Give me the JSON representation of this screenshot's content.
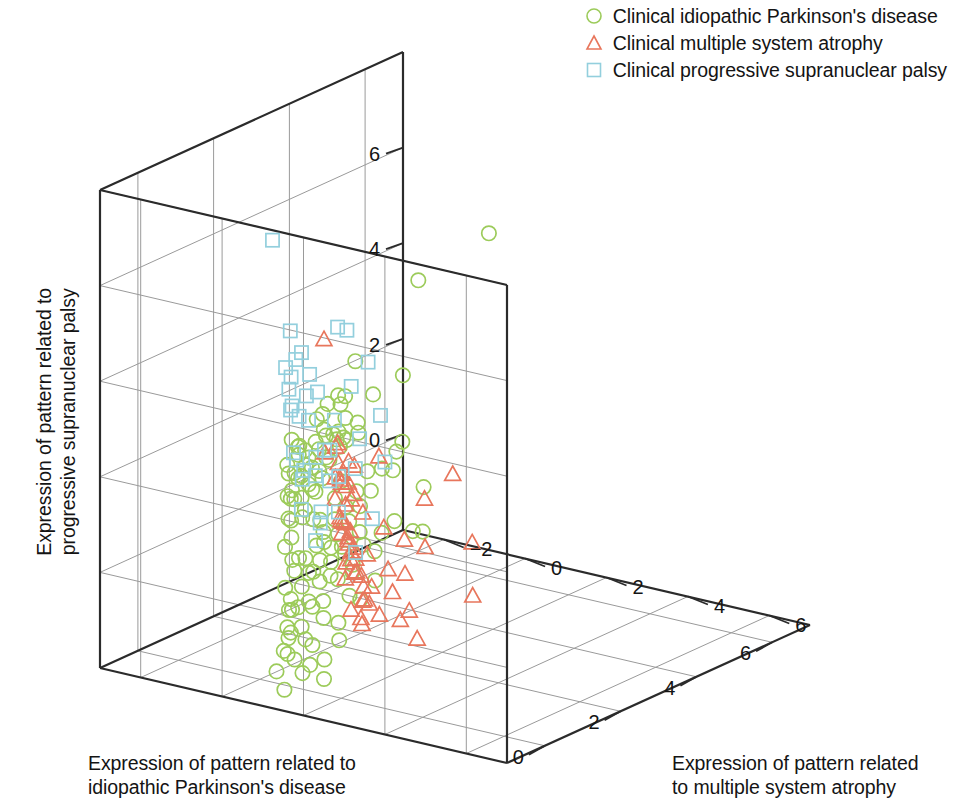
{
  "legend": {
    "position": "top-right",
    "items": [
      {
        "label": "Clinical idiopathic Parkinson's disease",
        "marker": "circle-marker",
        "color": "#9ccb5a"
      },
      {
        "label": "Clinical multiple system atrophy",
        "marker": "triangle-marker",
        "color": "#e8765c"
      },
      {
        "label": "Clinical progressive supranuclear palsy",
        "marker": "square-marker",
        "color": "#93cfdd"
      }
    ]
  },
  "axes": {
    "x": {
      "label_line1": "Expression of pattern related to",
      "label_line2": "idiopathic Parkinson's disease",
      "ticks": [
        "6",
        "4",
        "2",
        "0"
      ],
      "tick_values": [
        6,
        4,
        2,
        0
      ],
      "range": [
        -1,
        7
      ]
    },
    "y": {
      "label_line1": "Expression of pattern related to",
      "label_line2": "progressive supranuclear palsy",
      "ticks": [
        "0",
        "2",
        "4",
        "6"
      ],
      "tick_values": [
        0,
        2,
        4,
        6
      ],
      "range": [
        -2,
        8
      ]
    },
    "z": {
      "label_line1": "Expression of pattern related",
      "label_line2": "to multiple system atrophy",
      "ticks": [
        "−2",
        "0",
        "2",
        "4",
        "6"
      ],
      "tick_values": [
        -2,
        0,
        2,
        4,
        6
      ],
      "range": [
        -3,
        7
      ]
    }
  },
  "chart_data": {
    "type": "scatter",
    "projection": "3d",
    "title": "",
    "xlabel": "Expression of pattern related to idiopathic Parkinson's disease",
    "ylabel": "Expression of pattern related to progressive supranuclear palsy",
    "zlabel": "Expression of pattern related to multiple system atrophy",
    "xlim": [
      -1,
      7
    ],
    "ylim": [
      -2,
      8
    ],
    "zlim": [
      -3,
      7
    ],
    "grid": true,
    "legend_position": "top-right",
    "series": [
      {
        "name": "Clinical idiopathic Parkinson's disease",
        "marker": "circle",
        "color": "#9ccb5a",
        "points": [
          [
            5.9,
            3.9,
            -1.6
          ],
          [
            5.4,
            5.5,
            0.6
          ],
          [
            5.6,
            2.0,
            -1.7
          ],
          [
            4.6,
            2.0,
            -1.5
          ],
          [
            5.8,
            0.5,
            -1.9
          ],
          [
            4.3,
            1.5,
            -1.6
          ],
          [
            4.1,
            1.4,
            -1.4
          ],
          [
            3.9,
            1.3,
            -1.5
          ],
          [
            3.6,
            1.5,
            -1.3
          ],
          [
            3.4,
            1.4,
            -1.2
          ],
          [
            3.7,
            3.1,
            -1.1
          ],
          [
            3.2,
            2.4,
            -1.0
          ],
          [
            3.1,
            1.7,
            -1.0
          ],
          [
            2.9,
            1.9,
            -0.9
          ],
          [
            2.8,
            1.4,
            -0.9
          ],
          [
            3.0,
            0.9,
            -0.8
          ],
          [
            2.6,
            2.0,
            -0.8
          ],
          [
            2.5,
            1.6,
            -0.7
          ],
          [
            2.4,
            1.2,
            -0.7
          ],
          [
            2.3,
            2.6,
            -0.6
          ],
          [
            2.2,
            1.9,
            -0.6
          ],
          [
            2.1,
            1.5,
            -0.5
          ],
          [
            2.0,
            1.1,
            -0.5
          ],
          [
            1.9,
            2.2,
            -0.4
          ],
          [
            1.8,
            1.7,
            -0.4
          ],
          [
            1.7,
            1.3,
            -0.3
          ],
          [
            1.6,
            2.0,
            -0.3
          ],
          [
            1.5,
            1.5,
            -0.2
          ],
          [
            1.4,
            1.0,
            -0.2
          ],
          [
            1.3,
            2.3,
            -0.1
          ],
          [
            1.2,
            1.8,
            -0.1
          ],
          [
            1.1,
            1.4,
            0.0
          ],
          [
            1.0,
            2.5,
            0.0
          ],
          [
            0.9,
            1.9,
            0.1
          ],
          [
            0.8,
            1.5,
            0.1
          ],
          [
            0.7,
            2.1,
            0.2
          ],
          [
            0.6,
            1.6,
            0.2
          ],
          [
            0.5,
            1.2,
            0.3
          ],
          [
            0.4,
            2.4,
            0.3
          ],
          [
            0.3,
            1.8,
            0.4
          ],
          [
            5.0,
            0.7,
            -1.3
          ],
          [
            4.8,
            0.4,
            -1.2
          ],
          [
            4.4,
            0.6,
            -1.1
          ],
          [
            4.0,
            0.3,
            -1.0
          ],
          [
            3.8,
            0.8,
            -0.9
          ],
          [
            3.5,
            0.2,
            -0.8
          ],
          [
            3.3,
            0.6,
            -0.7
          ],
          [
            3.0,
            0.1,
            -0.6
          ],
          [
            2.8,
            0.5,
            -0.5
          ],
          [
            2.6,
            0.0,
            -0.5
          ],
          [
            2.4,
            0.4,
            -0.4
          ],
          [
            2.2,
            -0.1,
            -0.3
          ],
          [
            2.0,
            0.3,
            -0.3
          ],
          [
            1.8,
            -0.2,
            -0.2
          ],
          [
            1.6,
            0.2,
            -0.1
          ],
          [
            1.4,
            -0.3,
            -0.1
          ],
          [
            1.2,
            0.1,
            0.0
          ],
          [
            1.0,
            -0.4,
            0.1
          ],
          [
            0.8,
            0.0,
            0.1
          ],
          [
            0.6,
            -0.5,
            0.2
          ],
          [
            4.5,
            -0.8,
            -1.2
          ],
          [
            4.1,
            -1.0,
            -1.0
          ],
          [
            3.7,
            -0.7,
            -0.9
          ],
          [
            3.3,
            -1.1,
            -0.8
          ],
          [
            3.0,
            -0.6,
            -0.7
          ],
          [
            2.7,
            -1.0,
            -0.6
          ],
          [
            2.4,
            -0.8,
            -0.5
          ],
          [
            2.1,
            -1.2,
            -0.4
          ],
          [
            1.9,
            -0.7,
            -0.3
          ],
          [
            1.6,
            -1.1,
            -0.2
          ],
          [
            1.4,
            -0.9,
            -0.1
          ],
          [
            1.1,
            -1.3,
            0.0
          ],
          [
            0.9,
            -0.8,
            0.1
          ],
          [
            0.6,
            -1.2,
            0.2
          ],
          [
            0.4,
            -1.0,
            0.3
          ],
          [
            0.2,
            -1.4,
            0.4
          ],
          [
            3.9,
            -1.5,
            -0.8
          ],
          [
            3.4,
            -1.7,
            -0.7
          ],
          [
            2.9,
            -1.4,
            -0.5
          ],
          [
            2.5,
            -1.8,
            -0.4
          ],
          [
            2.0,
            -1.5,
            -0.3
          ],
          [
            1.6,
            -1.9,
            -0.2
          ],
          [
            1.2,
            -1.6,
            0.0
          ],
          [
            0.7,
            -1.8,
            0.2
          ],
          [
            0.3,
            -1.5,
            0.4
          ],
          [
            -0.1,
            -1.7,
            0.5
          ],
          [
            1.0,
            -2.0,
            0.3
          ],
          [
            2.2,
            -2.0,
            -0.1
          ],
          [
            0.5,
            2.8,
            0.5
          ],
          [
            0.2,
            2.0,
            0.6
          ],
          [
            0.0,
            1.5,
            0.7
          ],
          [
            -0.2,
            1.0,
            0.8
          ],
          [
            0.1,
            0.6,
            0.7
          ],
          [
            -0.3,
            0.2,
            0.9
          ],
          [
            0.3,
            3.0,
            0.5
          ],
          [
            -0.1,
            2.5,
            0.8
          ],
          [
            1.5,
            2.9,
            0.0
          ],
          [
            2.0,
            3.0,
            -0.2
          ],
          [
            2.6,
            2.9,
            -0.5
          ],
          [
            3.0,
            2.7,
            -0.7
          ],
          [
            1.3,
            0.9,
            0.1
          ],
          [
            1.7,
            0.7,
            -0.1
          ],
          [
            2.3,
            0.9,
            -0.3
          ],
          [
            0.9,
            1.1,
            0.2
          ],
          [
            0.4,
            0.9,
            0.4
          ],
          [
            1.1,
            2.1,
            0.1
          ],
          [
            0.7,
            2.5,
            0.3
          ],
          [
            1.9,
            2.5,
            -0.2
          ],
          [
            2.5,
            2.2,
            -0.4
          ],
          [
            2.9,
            2.3,
            -0.6
          ],
          [
            0.2,
            -0.5,
            0.6
          ],
          [
            0.0,
            -1.0,
            0.7
          ],
          [
            -0.2,
            -0.3,
            0.9
          ],
          [
            0.6,
            0.4,
            0.4
          ],
          [
            1.3,
            -0.2,
            0.1
          ],
          [
            1.8,
            0.2,
            -0.1
          ],
          [
            2.2,
            -0.4,
            -0.3
          ],
          [
            2.7,
            -0.3,
            -0.5
          ],
          [
            3.2,
            -0.9,
            -0.7
          ],
          [
            3.6,
            -0.4,
            -0.9
          ],
          [
            0.8,
            -2.1,
            0.3
          ],
          [
            1.7,
            -2.2,
            0.0
          ],
          [
            0.0,
            -2.1,
            0.6
          ],
          [
            2.6,
            1.4,
            1.6
          ],
          [
            2.1,
            0.7,
            1.8
          ],
          [
            1.4,
            1.2,
            2.0
          ],
          [
            2.9,
            0.3,
            1.3
          ],
          [
            0.4,
            -1.9,
            1.2
          ]
        ]
      },
      {
        "name": "Clinical multiple system atrophy",
        "marker": "triangle",
        "color": "#e8765c",
        "points": [
          [
            0.4,
            5.2,
            1.2
          ],
          [
            -0.3,
            3.4,
            3.2
          ],
          [
            -0.6,
            2.9,
            4.6
          ],
          [
            -0.5,
            3.5,
            5.2
          ],
          [
            -0.2,
            2.8,
            2.2
          ],
          [
            0.0,
            2.5,
            2.0
          ],
          [
            0.3,
            2.4,
            1.7
          ],
          [
            0.6,
            2.9,
            1.3
          ],
          [
            -0.4,
            2.2,
            2.9
          ],
          [
            -0.6,
            2.1,
            3.6
          ],
          [
            -0.7,
            2.0,
            4.2
          ],
          [
            -0.8,
            2.0,
            4.8
          ],
          [
            -0.3,
            1.7,
            2.5
          ],
          [
            -0.1,
            1.5,
            2.1
          ],
          [
            0.2,
            1.6,
            1.8
          ],
          [
            0.5,
            1.5,
            1.5
          ],
          [
            0.8,
            1.7,
            1.1
          ],
          [
            -0.5,
            1.4,
            3.1
          ],
          [
            -0.7,
            1.3,
            3.8
          ],
          [
            -0.9,
            1.4,
            4.4
          ],
          [
            0.0,
            1.2,
            2.3
          ],
          [
            0.3,
            1.1,
            1.9
          ],
          [
            0.6,
            1.0,
            1.6
          ],
          [
            0.9,
            1.2,
            1.2
          ],
          [
            -0.4,
            0.9,
            2.7
          ],
          [
            -0.6,
            0.8,
            3.3
          ],
          [
            -0.8,
            0.9,
            4.0
          ],
          [
            -1.0,
            0.7,
            4.6
          ],
          [
            0.1,
            0.6,
            2.4
          ],
          [
            0.4,
            0.5,
            2.0
          ],
          [
            0.7,
            0.6,
            1.7
          ],
          [
            1.0,
            0.4,
            1.3
          ],
          [
            -0.3,
            0.3,
            2.8
          ],
          [
            -0.5,
            0.2,
            3.4
          ],
          [
            -0.7,
            0.3,
            4.1
          ],
          [
            -0.9,
            0.1,
            4.7
          ],
          [
            0.2,
            0.0,
            2.5
          ],
          [
            0.5,
            -0.1,
            2.1
          ],
          [
            0.8,
            0.0,
            1.8
          ],
          [
            1.2,
            1.8,
            1.0
          ],
          [
            1.4,
            1.3,
            0.8
          ],
          [
            1.6,
            0.8,
            0.6
          ],
          [
            1.9,
            1.5,
            0.4
          ],
          [
            2.2,
            1.0,
            0.2
          ],
          [
            1.1,
            2.3,
            0.9
          ],
          [
            1.3,
            2.6,
            0.7
          ],
          [
            0.9,
            -0.6,
            1.4
          ],
          [
            1.5,
            -0.3,
            0.7
          ],
          [
            2.4,
            -0.2,
            0.0
          ],
          [
            2.0,
            0.3,
            0.3
          ],
          [
            -0.2,
            2.0,
            5.4
          ],
          [
            -0.4,
            1.0,
            5.6
          ],
          [
            0.1,
            3.0,
            1.5
          ],
          [
            0.7,
            2.2,
            1.2
          ],
          [
            1.8,
            2.0,
            0.5
          ],
          [
            2.6,
            1.5,
            -0.1
          ],
          [
            1.2,
            0.2,
            1.0
          ],
          [
            0.3,
            -0.4,
            2.2
          ],
          [
            -0.1,
            -0.3,
            2.6
          ],
          [
            2.8,
            0.8,
            -0.3
          ]
        ]
      },
      {
        "name": "Clinical progressive supranuclear palsy",
        "marker": "square",
        "color": "#93cfdd",
        "points": [
          [
            -0.1,
            7.3,
            0.4
          ],
          [
            -0.5,
            6.0,
            2.6
          ],
          [
            -0.8,
            5.6,
            3.4
          ],
          [
            -0.3,
            5.2,
            1.3
          ],
          [
            0.3,
            4.7,
            0.6
          ],
          [
            -0.6,
            4.9,
            2.8
          ],
          [
            -0.9,
            4.6,
            3.8
          ],
          [
            -0.2,
            4.4,
            1.6
          ],
          [
            0.5,
            4.2,
            0.3
          ],
          [
            -0.4,
            4.0,
            2.2
          ],
          [
            -0.7,
            3.9,
            3.1
          ],
          [
            -1.0,
            3.7,
            4.0
          ],
          [
            0.1,
            3.6,
            1.1
          ],
          [
            0.7,
            3.4,
            0.1
          ],
          [
            -0.3,
            3.3,
            2.0
          ],
          [
            -0.6,
            3.2,
            2.9
          ],
          [
            1.0,
            4.1,
            -0.3
          ],
          [
            1.3,
            3.5,
            -0.5
          ],
          [
            0.2,
            3.0,
            1.4
          ],
          [
            -0.5,
            2.9,
            2.4
          ],
          [
            1.6,
            3.0,
            -0.7
          ],
          [
            2.0,
            2.6,
            -0.9
          ],
          [
            0.4,
            2.7,
            1.0
          ],
          [
            -0.2,
            2.6,
            1.9
          ],
          [
            1.1,
            2.3,
            -0.2
          ],
          [
            0.6,
            2.2,
            0.8
          ],
          [
            -0.4,
            2.1,
            2.3
          ],
          [
            0.9,
            1.9,
            0.2
          ],
          [
            1.4,
            2.0,
            -0.4
          ],
          [
            0.0,
            1.8,
            1.5
          ],
          [
            2.3,
            2.9,
            -1.0
          ],
          [
            1.8,
            1.6,
            -0.6
          ],
          [
            -0.7,
            1.5,
            3.0
          ],
          [
            0.3,
            1.4,
            1.2
          ],
          [
            -0.1,
            5.8,
            2.0
          ],
          [
            0.8,
            5.0,
            0.0
          ],
          [
            -0.9,
            2.4,
            3.6
          ],
          [
            2.6,
            3.2,
            -1.2
          ],
          [
            1.2,
            1.1,
            -0.1
          ],
          [
            0.5,
            0.9,
            0.9
          ]
        ]
      }
    ]
  }
}
